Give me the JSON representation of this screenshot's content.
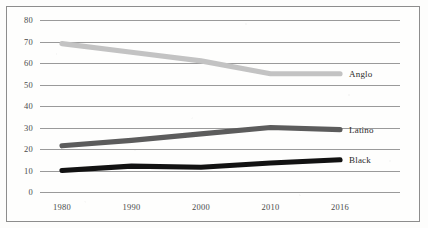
{
  "chart_data": {
    "type": "line",
    "title": "",
    "subtitle": "",
    "xlabel": "",
    "ylabel": "",
    "categories": [
      "1980",
      "1990",
      "2000",
      "2010",
      "2016"
    ],
    "ylim": [
      0,
      80
    ],
    "yticks": [
      "0",
      "10",
      "20",
      "30",
      "40",
      "50",
      "60",
      "70",
      "80"
    ],
    "grid": "horizontal",
    "legend_position": "line-end-right",
    "series": [
      {
        "name": "Anglo",
        "color": "#c3c3c3",
        "values": [
          69,
          65,
          61,
          55,
          55
        ]
      },
      {
        "name": "Latino",
        "color": "#5c5c5c",
        "values": [
          21.5,
          24,
          27,
          30,
          29
        ]
      },
      {
        "name": "Black",
        "color": "#121212",
        "values": [
          10,
          12,
          11.5,
          13.5,
          15
        ]
      }
    ]
  },
  "figure": {
    "background_color": "#fdfdfc",
    "border_color": "#8d8d8d",
    "gridline_color": "#9a9a9a",
    "tick_label_color": "#4a4a4a"
  }
}
